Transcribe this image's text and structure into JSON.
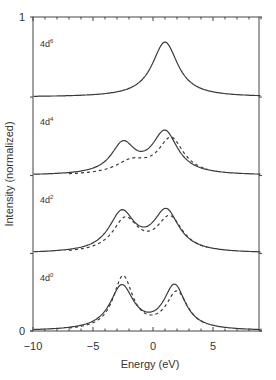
{
  "chart_data": {
    "type": "line",
    "title": "",
    "xlabel": "Energy (eV)",
    "ylabel": "Intensity (normalized)",
    "xlim": [
      -10,
      9
    ],
    "ylim": [
      0,
      1
    ],
    "xticks": [
      -10,
      -5,
      0,
      5
    ],
    "yticks": [
      0,
      1
    ],
    "grid": false,
    "legend": null,
    "panels": [
      {
        "label": "4d6",
        "label_text": "4d",
        "label_sup": "6",
        "baseline_frac": 0.745,
        "series": [
          {
            "name": "solid",
            "style": "solid",
            "peaks": [
              {
                "x": 1.0,
                "height": 0.175,
                "width": 1.3
              }
            ]
          }
        ]
      },
      {
        "label": "4d4",
        "label_text": "4d",
        "label_sup": "4",
        "baseline_frac": 0.495,
        "series": [
          {
            "name": "solid",
            "style": "solid",
            "peaks": [
              {
                "x": -2.5,
                "height": 0.095,
                "width": 1.2
              },
              {
                "x": 1.0,
                "height": 0.135,
                "width": 1.3
              }
            ]
          },
          {
            "name": "dashed",
            "style": "dashed",
            "peaks": [
              {
                "x": -1.8,
                "height": 0.04,
                "width": 1.6
              },
              {
                "x": 1.5,
                "height": 0.115,
                "width": 1.3
              }
            ]
          }
        ]
      },
      {
        "label": "4d2",
        "label_text": "4d",
        "label_sup": "2",
        "baseline_frac": 0.247,
        "series": [
          {
            "name": "solid",
            "style": "solid",
            "peaks": [
              {
                "x": -2.6,
                "height": 0.125,
                "width": 1.3
              },
              {
                "x": 1.1,
                "height": 0.13,
                "width": 1.3
              }
            ]
          },
          {
            "name": "dashed",
            "style": "dashed",
            "peaks": [
              {
                "x": -2.3,
                "height": 0.105,
                "width": 1.3
              },
              {
                "x": 1.4,
                "height": 0.11,
                "width": 1.3
              }
            ]
          }
        ]
      },
      {
        "label": "4d0",
        "label_text": "4d",
        "label_sup": "0",
        "baseline_frac": 0.0,
        "series": [
          {
            "name": "solid",
            "style": "solid",
            "peaks": [
              {
                "x": -2.6,
                "height": 0.14,
                "width": 1.2
              },
              {
                "x": 1.8,
                "height": 0.14,
                "width": 1.1
              }
            ]
          },
          {
            "name": "dashed",
            "style": "dashed",
            "peaks": [
              {
                "x": -2.5,
                "height": 0.17,
                "width": 1.0
              },
              {
                "x": 2.0,
                "height": 0.12,
                "width": 1.1
              }
            ]
          }
        ]
      }
    ]
  },
  "axes": {
    "xlabel": "Energy (eV)",
    "ylabel": "Intensity (normalized)",
    "xtick_labels": [
      "−10",
      "−5",
      "0",
      "5"
    ],
    "ytick_labels": {
      "top": "1",
      "bottom": "0"
    }
  },
  "colors": {
    "line": "#3a3a3a",
    "axis": "#444444",
    "background": "#ffffff"
  }
}
